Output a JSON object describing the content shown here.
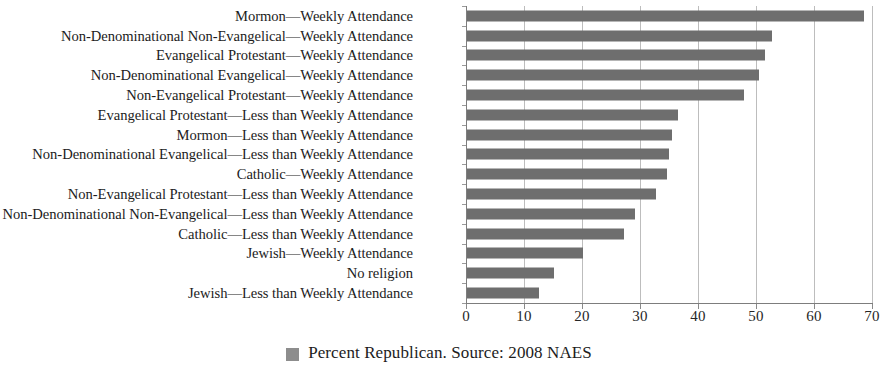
{
  "chart_data": {
    "type": "bar",
    "orientation": "horizontal",
    "title": "",
    "xlabel": "",
    "ylabel": "",
    "xlim": [
      0,
      70
    ],
    "xticks": [
      "0",
      "10",
      "20",
      "30",
      "40",
      "50",
      "60",
      "70"
    ],
    "grid": true,
    "legend_position": "bottom-center",
    "legend": [
      "Percent Republican. Source: 2008 NAES"
    ],
    "series_name": "Percent Republican",
    "bar_color": "#6e6e6e",
    "categories": [
      "Mormon—Weekly Attendance",
      "Non-Denominational Non-Evangelical—Weekly Attendance",
      "Evangelical Protestant—Weekly Attendance",
      "Non-Denominational Evangelical—Weekly Attendance",
      "Non-Evangelical Protestant—Weekly Attendance",
      "Evangelical Protestant—Less than Weekly Attendance",
      "Mormon—Less than Weekly Attendance",
      "Non-Denominational Evangelical—Less than Weekly Attendance",
      "Catholic—Weekly Attendance",
      "Non-Evangelical Protestant—Less than Weekly Attendance",
      "Non-Denominational Non-Evangelical—Less than Weekly Attendance",
      "Catholic—Less than Weekly Attendance",
      "Jewish—Weekly Attendance",
      "No religion",
      "Jewish—Less than Weekly Attendance"
    ],
    "values": [
      68.5,
      52.6,
      51.4,
      50.3,
      47.8,
      36.4,
      35.3,
      34.8,
      34.5,
      32.6,
      29.0,
      27.0,
      20.0,
      15.0,
      12.4
    ]
  },
  "legend": {
    "label": "Percent Republican. Source: 2008 NAES",
    "swatch_color": "#8d8d8d"
  }
}
